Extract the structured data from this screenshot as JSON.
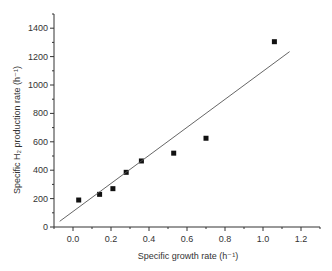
{
  "chart_data": {
    "type": "scatter",
    "title": "",
    "xlabel": "Specific growth rate (h⁻¹)",
    "ylabel": "Specific H₂ production rate (h⁻¹)",
    "xlim": [
      -0.1,
      1.3
    ],
    "ylim": [
      0,
      1500
    ],
    "xticks": [
      0.0,
      0.2,
      0.4,
      0.6,
      0.8,
      1.0,
      1.2
    ],
    "xtick_labels": [
      "0.0",
      "0.2",
      "0.4",
      "0.6",
      "0.8",
      "1.0",
      "1.2"
    ],
    "yticks": [
      0,
      200,
      400,
      600,
      800,
      1000,
      1200,
      1400
    ],
    "ytick_labels": [
      "0",
      "200",
      "400",
      "600",
      "800",
      "1000",
      "1200",
      "1400"
    ],
    "grid": false,
    "legend": null,
    "series": [
      {
        "name": "data",
        "marker": "square",
        "color": "#111111",
        "x": [
          0.03,
          0.14,
          0.21,
          0.28,
          0.36,
          0.53,
          0.7,
          1.06
        ],
        "y": [
          190,
          230,
          270,
          385,
          465,
          520,
          625,
          1305
        ]
      },
      {
        "name": "linear fit",
        "style": "line",
        "color": "#555555",
        "x": [
          -0.07,
          1.14
        ],
        "y": [
          40,
          1235
        ]
      }
    ]
  }
}
